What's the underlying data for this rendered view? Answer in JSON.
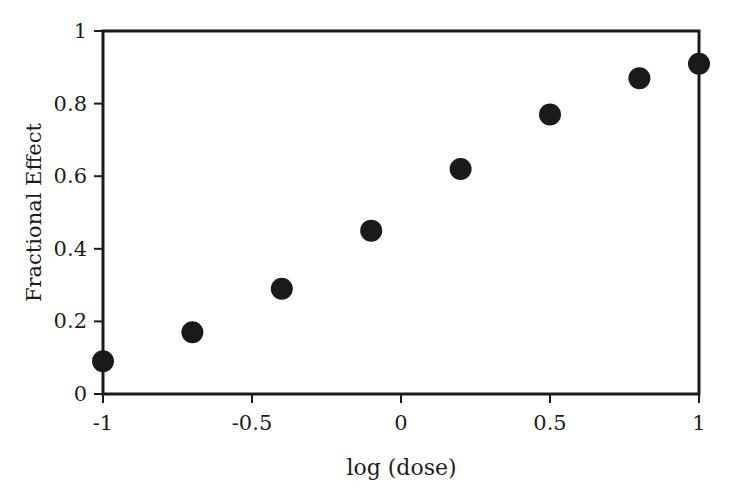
{
  "chart_data": {
    "type": "scatter",
    "title": "",
    "xlabel": "log (dose)",
    "ylabel": "Fractional Effect",
    "xlim": [
      -1,
      1
    ],
    "ylim": [
      0,
      1
    ],
    "grid": false,
    "legend": null,
    "marker": {
      "shape": "filled-circle",
      "color": "#1a1a1a",
      "size_px": 22
    },
    "axis": {
      "color": "#1a1a1a",
      "line_width_px": 3,
      "tick_direction": "out",
      "spines": [
        "left",
        "right",
        "top",
        "bottom"
      ]
    },
    "xticks": [
      -1,
      -0.5,
      0,
      0.5,
      1
    ],
    "xtick_labels": [
      "-1",
      "-0.5",
      "0",
      "0.5",
      "1"
    ],
    "yticks": [
      0,
      0.2,
      0.4,
      0.6,
      0.8,
      1
    ],
    "ytick_labels": [
      "0",
      "0.2",
      "0.4",
      "0.6",
      "0.8",
      "1"
    ],
    "x": [
      -1,
      -0.7,
      -0.4,
      -0.1,
      0.2,
      0.5,
      0.8,
      1
    ],
    "y": [
      0.09,
      0.17,
      0.29,
      0.45,
      0.62,
      0.77,
      0.87,
      0.91
    ],
    "points": [
      {
        "x": -1,
        "y": 0.09
      },
      {
        "x": -0.7,
        "y": 0.17
      },
      {
        "x": -0.4,
        "y": 0.29
      },
      {
        "x": -0.1,
        "y": 0.45
      },
      {
        "x": 0.2,
        "y": 0.62
      },
      {
        "x": 0.5,
        "y": 0.77
      },
      {
        "x": 0.8,
        "y": 0.87
      },
      {
        "x": 1,
        "y": 0.91
      }
    ]
  },
  "figure": {
    "background": "#ffffff",
    "plot_box": {
      "left": 103,
      "top": 31,
      "right": 699,
      "bottom": 394
    }
  }
}
